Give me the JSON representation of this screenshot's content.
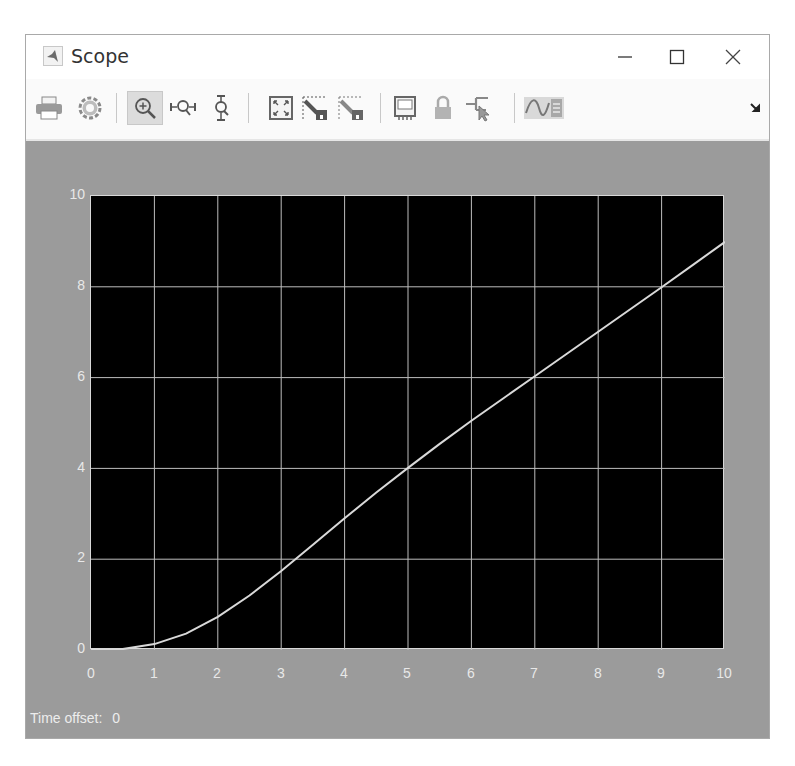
{
  "window": {
    "title": "Scope",
    "controls": {
      "minimize": "minimize",
      "maximize": "maximize",
      "close": "close"
    }
  },
  "toolbar": {
    "items": [
      {
        "name": "print",
        "icon": "printer-icon"
      },
      {
        "name": "settings",
        "icon": "gear-icon"
      },
      {
        "name": "zoom-in",
        "icon": "zoom-in-icon",
        "active": true
      },
      {
        "name": "zoom-x",
        "icon": "zoom-x-icon"
      },
      {
        "name": "zoom-y",
        "icon": "zoom-y-icon"
      },
      {
        "name": "zoom-to-fit",
        "icon": "fit-to-view-icon"
      },
      {
        "name": "scale-x-y-axes",
        "icon": "autoscale-icon"
      },
      {
        "name": "scale-axes-alt",
        "icon": "autoscale-alt-icon"
      },
      {
        "name": "highlight-simulink-block",
        "icon": "monitor-icon"
      },
      {
        "name": "lock-layout",
        "icon": "lock-icon"
      },
      {
        "name": "signal-selector",
        "icon": "cursor-signal-icon"
      },
      {
        "name": "legend",
        "icon": "signal-legend-icon"
      },
      {
        "name": "undock",
        "icon": "undock-arrow-icon"
      }
    ]
  },
  "status": {
    "time_offset_label": "Time offset:",
    "time_offset_value": "0"
  },
  "colors": {
    "plot_bg": "#000000",
    "figure_bg": "#9b9b9b",
    "grid": "#bdbdbd",
    "line": "#d9d9d9",
    "tick_text": "#e8e8e8"
  },
  "chart_data": {
    "type": "line",
    "title": "",
    "xlabel": "",
    "ylabel": "",
    "xlim": [
      0,
      10
    ],
    "ylim": [
      0,
      10
    ],
    "grid": true,
    "legend": null,
    "x_ticks": [
      "0",
      "1",
      "2",
      "3",
      "4",
      "5",
      "6",
      "7",
      "8",
      "9",
      "10"
    ],
    "y_ticks": [
      "0",
      "2",
      "4",
      "6",
      "8",
      "10"
    ],
    "series": [
      {
        "name": "signal",
        "x": [
          0,
          0.5,
          1,
          1.5,
          2,
          2.5,
          3,
          3.5,
          4,
          4.5,
          5,
          5.5,
          6,
          6.5,
          7,
          7.5,
          8,
          8.5,
          9,
          9.5,
          10
        ],
        "y": [
          0,
          0.02,
          0.13,
          0.36,
          0.73,
          1.2,
          1.74,
          2.32,
          2.9,
          3.47,
          4.01,
          4.54,
          5.05,
          5.54,
          6.03,
          6.52,
          7.01,
          7.5,
          7.99,
          8.49,
          8.99
        ]
      }
    ]
  }
}
